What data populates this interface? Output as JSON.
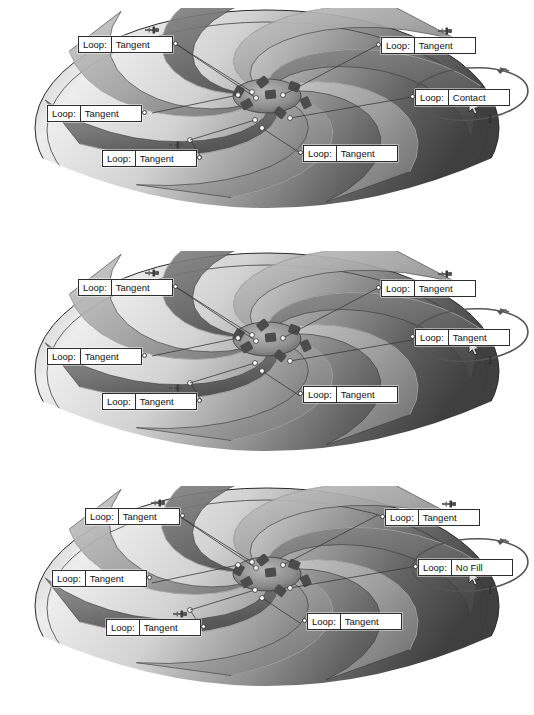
{
  "document": {
    "title": "Pump impeller surface loop callouts",
    "panel_count": 3
  },
  "label_key": "Loop:",
  "icons": {
    "pushpin": "pushpin-icon",
    "cursor": "mouse-pointer-icon",
    "ibeam": "I",
    "connector": "connector-dot-icon",
    "highlight": "ellipse-highlight-icon"
  },
  "colors": {
    "label_border": "#2d2d2d",
    "label_background": "#ffffff",
    "label_text": "#111111",
    "leader_line": "#3a3a3a",
    "highlight_ellipse": "#555555",
    "impeller_light": "#e8e8e8",
    "impeller_mid": "#b9b9b9",
    "impeller_dark": "#6a6a6a",
    "impeller_shadow": "#3c3c3c"
  },
  "panels": [
    {
      "id": "panel-1",
      "name": "panel-contact",
      "highlighted_value": "Contact",
      "callouts": [
        {
          "key": "Loop:",
          "value": "Tangent",
          "side": "right",
          "x": 78,
          "y": 36,
          "pin": {
            "x": 144,
            "y": 21
          }
        },
        {
          "key": "Loop:",
          "value": "Tangent",
          "side": "right",
          "x": 47,
          "y": 105,
          "pin": null
        },
        {
          "key": "Loop:",
          "value": "Tangent",
          "side": "right",
          "x": 102,
          "y": 150,
          "pin": {
            "x": 168,
            "y": 136
          }
        },
        {
          "key": "Loop:",
          "value": "Tangent",
          "side": "left",
          "x": 381,
          "y": 37,
          "pin": {
            "x": 437,
            "y": 22
          }
        },
        {
          "key": "Loop:",
          "value": "Contact",
          "side": "left",
          "x": 415,
          "y": 89,
          "pin": null
        },
        {
          "key": "Loop:",
          "value": "Tangent",
          "side": "left",
          "x": 303,
          "y": 145,
          "pin": null
        }
      ]
    },
    {
      "id": "panel-2",
      "name": "panel-tangent",
      "highlighted_value": "Tangent",
      "callouts": [
        {
          "key": "Loop:",
          "value": "Tangent",
          "side": "right",
          "x": 78,
          "y": 36,
          "pin": {
            "x": 144,
            "y": 21
          }
        },
        {
          "key": "Loop:",
          "value": "Tangent",
          "side": "right",
          "x": 47,
          "y": 105,
          "pin": null
        },
        {
          "key": "Loop:",
          "value": "Tangent",
          "side": "right",
          "x": 102,
          "y": 150,
          "pin": {
            "x": 168,
            "y": 136
          }
        },
        {
          "key": "Loop:",
          "value": "Tangent",
          "side": "left",
          "x": 381,
          "y": 37,
          "pin": {
            "x": 437,
            "y": 22
          }
        },
        {
          "key": "Loop:",
          "value": "Tangent",
          "side": "left",
          "x": 415,
          "y": 86,
          "pin": null
        },
        {
          "key": "Loop:",
          "value": "Tangent",
          "side": "left",
          "x": 303,
          "y": 143,
          "pin": null
        }
      ]
    },
    {
      "id": "panel-3",
      "name": "panel-no-fill",
      "highlighted_value": "No Fill",
      "callouts": [
        {
          "key": "Loop:",
          "value": "Tangent",
          "side": "right",
          "x": 85,
          "y": 30,
          "pin": {
            "x": 150,
            "y": 16
          }
        },
        {
          "key": "Loop:",
          "value": "Tangent",
          "side": "right",
          "x": 52,
          "y": 92,
          "pin": null
        },
        {
          "key": "Loop:",
          "value": "Tangent",
          "side": "right",
          "x": 106,
          "y": 141,
          "pin": {
            "x": 172,
            "y": 127
          }
        },
        {
          "key": "Loop:",
          "value": "Tangent",
          "side": "left",
          "x": 385,
          "y": 31,
          "pin": {
            "x": 441,
            "y": 17
          }
        },
        {
          "key": "Loop:",
          "value": "No Fill",
          "side": "left",
          "x": 418,
          "y": 81,
          "pin": null
        },
        {
          "key": "Loop:",
          "value": "Tangent",
          "side": "left",
          "x": 307,
          "y": 135,
          "pin": null
        }
      ]
    }
  ]
}
